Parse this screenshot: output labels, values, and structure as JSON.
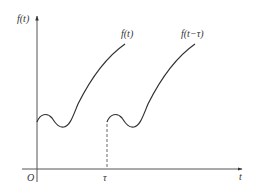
{
  "diagram": {
    "colors": {
      "axis": "#555555",
      "curve": "#333333",
      "text": "#333333"
    },
    "y_axis_label": "f(t)",
    "x_axis_label": "t",
    "origin_label": "O",
    "shift_label": "τ",
    "curves": [
      {
        "label": "f(t)",
        "start": "O"
      },
      {
        "label": "f(t−τ)",
        "start": "τ"
      }
    ]
  }
}
